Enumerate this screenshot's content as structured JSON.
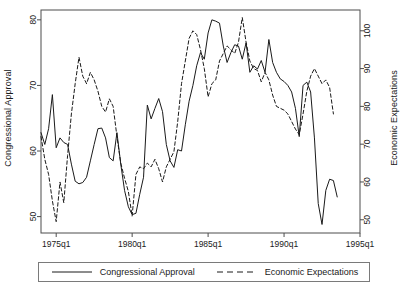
{
  "chart_data": {
    "type": "line",
    "title": "",
    "xlabel": "",
    "ylabel": "Congressional Approval",
    "y2label": "Economic Expectations",
    "grid": false,
    "legend_position": "bottom",
    "xlim": [
      1974.0,
      1995.0
    ],
    "ylim": [
      47.5,
      81.5
    ],
    "y2lim": [
      46.5,
      105.5
    ],
    "xticks": [
      "1975q1",
      "1980q1",
      "1985q1",
      "1990q1",
      "1995q1"
    ],
    "xtick_values": [
      1975.0,
      1980.0,
      1985.0,
      1990.0,
      1995.0
    ],
    "yticks": [
      50,
      60,
      70,
      80
    ],
    "y2ticks": [
      50,
      60,
      70,
      80,
      90,
      100
    ],
    "series": [
      {
        "name": "Congressional Approval",
        "axis": "left",
        "style": "solid",
        "color": "#1a1a1a",
        "x": [
          1974.0,
          1974.25,
          1974.5,
          1974.75,
          1975.0,
          1975.25,
          1975.5,
          1975.75,
          1976.0,
          1976.25,
          1976.5,
          1976.75,
          1977.0,
          1977.25,
          1977.5,
          1977.75,
          1978.0,
          1978.25,
          1978.5,
          1978.75,
          1979.0,
          1979.25,
          1979.5,
          1979.75,
          1980.0,
          1980.25,
          1980.5,
          1980.75,
          1981.0,
          1981.25,
          1981.5,
          1981.75,
          1982.0,
          1982.25,
          1982.5,
          1982.75,
          1983.0,
          1983.25,
          1983.5,
          1983.75,
          1984.0,
          1984.25,
          1984.5,
          1984.75,
          1985.0,
          1985.25,
          1985.5,
          1985.75,
          1986.0,
          1986.25,
          1986.5,
          1986.75,
          1987.0,
          1987.25,
          1987.5,
          1987.75,
          1988.0,
          1988.25,
          1988.5,
          1988.75,
          1989.0,
          1989.25,
          1989.5,
          1989.75,
          1990.0,
          1990.25,
          1990.5,
          1990.75,
          1991.0,
          1991.25,
          1991.5,
          1991.75,
          1992.0,
          1992.25,
          1992.5,
          1992.75,
          1993.0,
          1993.25,
          1993.5
        ],
        "y": [
          62.8,
          61.0,
          63.4,
          68.6,
          60.5,
          62.0,
          61.3,
          61.0,
          58.0,
          55.4,
          55.0,
          55.2,
          56.0,
          58.5,
          61.0,
          63.4,
          63.5,
          62.0,
          59.0,
          58.5,
          62.8,
          58.0,
          54.0,
          51.5,
          50.3,
          50.5,
          53.4,
          56.0,
          67.0,
          64.9,
          66.5,
          68.0,
          66.0,
          61.0,
          58.5,
          57.5,
          60.2,
          60.0,
          64.0,
          67.6,
          70.0,
          73.0,
          75.0,
          74.0,
          78.0,
          80.0,
          79.8,
          79.5,
          76.0,
          73.5,
          75.0,
          76.2,
          76.0,
          74.0,
          76.5,
          72.0,
          73.0,
          72.5,
          73.8,
          72.0,
          77.0,
          73.5,
          72.0,
          71.0,
          70.6,
          70.0,
          69.0,
          66.5,
          62.2,
          70.0,
          70.5,
          69.0,
          62.0,
          52.0,
          48.8,
          54.0,
          55.7,
          55.5,
          53.0
        ]
      },
      {
        "name": "Economic Expectations",
        "axis": "right",
        "style": "dashed",
        "color": "#1a1a1a",
        "x": [
          1974.0,
          1974.25,
          1974.5,
          1974.75,
          1975.0,
          1975.25,
          1975.5,
          1975.75,
          1976.0,
          1976.25,
          1976.5,
          1976.75,
          1977.0,
          1977.25,
          1977.5,
          1977.75,
          1978.0,
          1978.25,
          1978.5,
          1978.75,
          1979.0,
          1979.25,
          1979.5,
          1979.75,
          1980.0,
          1980.25,
          1980.5,
          1980.75,
          1981.0,
          1981.25,
          1981.5,
          1981.75,
          1982.0,
          1982.25,
          1982.5,
          1982.75,
          1983.0,
          1983.25,
          1983.5,
          1983.75,
          1984.0,
          1984.25,
          1984.5,
          1984.75,
          1985.0,
          1985.25,
          1985.5,
          1985.75,
          1986.0,
          1986.25,
          1986.5,
          1986.75,
          1987.0,
          1987.25,
          1987.5,
          1987.75,
          1988.0,
          1988.25,
          1988.5,
          1988.75,
          1989.0,
          1989.25,
          1989.5,
          1989.75,
          1990.0,
          1990.25,
          1990.5,
          1990.75,
          1991.0,
          1991.25,
          1991.5,
          1991.75,
          1992.0,
          1992.25,
          1992.5,
          1992.75,
          1993.0,
          1993.25
        ],
        "y": [
          72.0,
          66.0,
          62.0,
          55.0,
          49.5,
          60.0,
          54.5,
          67.0,
          78.0,
          86.0,
          93.0,
          88.0,
          86.0,
          89.0,
          87.0,
          84.0,
          80.0,
          78.5,
          82.0,
          80.0,
          72.0,
          65.0,
          61.0,
          57.5,
          51.0,
          62.0,
          64.0,
          63.5,
          65.0,
          64.0,
          66.0,
          63.5,
          60.0,
          64.0,
          66.0,
          68.0,
          76.0,
          86.0,
          92.0,
          98.0,
          100.0,
          99.0,
          95.0,
          90.0,
          82.5,
          86.0,
          87.0,
          92.0,
          94.0,
          96.0,
          95.0,
          94.0,
          97.0,
          103.5,
          97.0,
          92.0,
          90.0,
          89.5,
          86.5,
          89.0,
          87.0,
          83.0,
          80.0,
          79.5,
          79.0,
          78.0,
          76.0,
          74.0,
          72.5,
          78.0,
          84.0,
          88.0,
          90.0,
          88.0,
          86.0,
          87.0,
          85.0,
          78.0
        ]
      }
    ]
  },
  "legend": {
    "entries": [
      {
        "label": "Congressional Approval",
        "style": "solid"
      },
      {
        "label": "Economic Expectations",
        "style": "dashed"
      }
    ]
  }
}
